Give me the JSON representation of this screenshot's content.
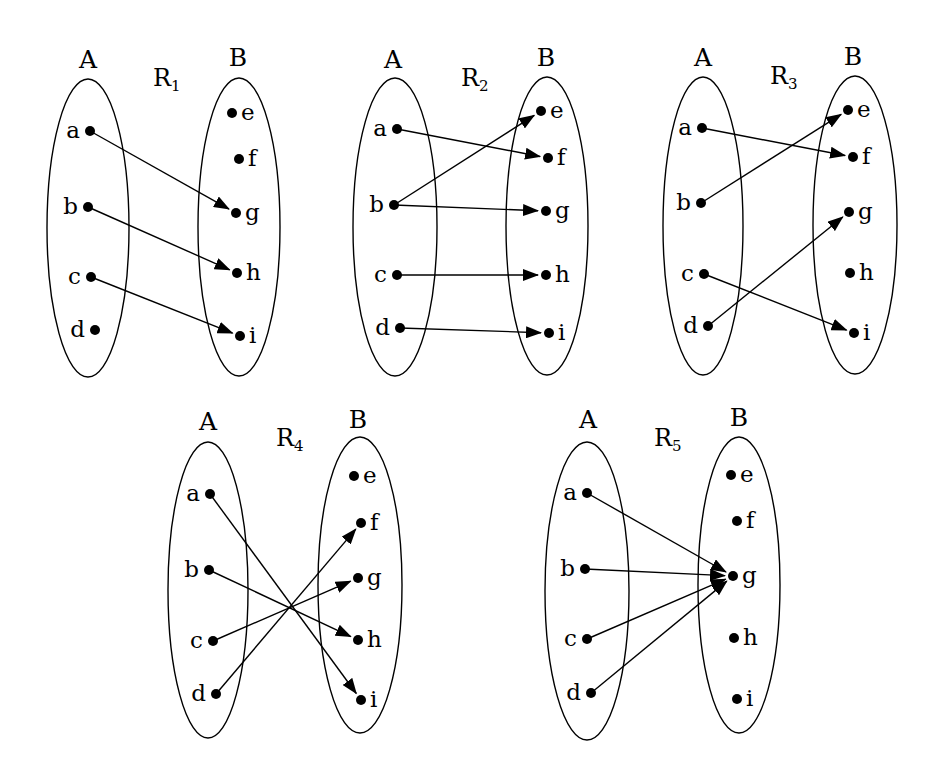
{
  "figure": {
    "colors": {
      "line": "#000000",
      "background": "#ffffff"
    },
    "diagrams": [
      {
        "name": "R",
        "subscript": "1",
        "domain_label": "A",
        "codomain_label": "B",
        "domain": [
          "a",
          "b",
          "c",
          "d"
        ],
        "codomain": [
          "e",
          "f",
          "g",
          "h",
          "i"
        ],
        "mapping": [
          [
            "a",
            "g"
          ],
          [
            "b",
            "h"
          ],
          [
            "c",
            "i"
          ]
        ]
      },
      {
        "name": "R",
        "subscript": "2",
        "domain_label": "A",
        "codomain_label": "B",
        "domain": [
          "a",
          "b",
          "c",
          "d"
        ],
        "codomain": [
          "e",
          "f",
          "g",
          "h",
          "i"
        ],
        "mapping": [
          [
            "a",
            "f"
          ],
          [
            "b",
            "e"
          ],
          [
            "b",
            "g"
          ],
          [
            "c",
            "h"
          ],
          [
            "d",
            "i"
          ]
        ]
      },
      {
        "name": "R",
        "subscript": "3",
        "domain_label": "A",
        "codomain_label": "B",
        "domain": [
          "a",
          "b",
          "c",
          "d"
        ],
        "codomain": [
          "e",
          "f",
          "g",
          "h",
          "i"
        ],
        "mapping": [
          [
            "a",
            "f"
          ],
          [
            "b",
            "e"
          ],
          [
            "c",
            "i"
          ],
          [
            "d",
            "g"
          ]
        ]
      },
      {
        "name": "R",
        "subscript": "4",
        "domain_label": "A",
        "codomain_label": "B",
        "domain": [
          "a",
          "b",
          "c",
          "d"
        ],
        "codomain": [
          "e",
          "f",
          "g",
          "h",
          "i"
        ],
        "mapping": [
          [
            "a",
            "i"
          ],
          [
            "b",
            "h"
          ],
          [
            "c",
            "g"
          ],
          [
            "d",
            "f"
          ]
        ]
      },
      {
        "name": "R",
        "subscript": "5",
        "domain_label": "A",
        "codomain_label": "B",
        "domain": [
          "a",
          "b",
          "c",
          "d"
        ],
        "codomain": [
          "e",
          "f",
          "g",
          "h",
          "i"
        ],
        "mapping": [
          [
            "a",
            "g"
          ],
          [
            "b",
            "g"
          ],
          [
            "c",
            "g"
          ],
          [
            "d",
            "g"
          ]
        ]
      }
    ]
  }
}
